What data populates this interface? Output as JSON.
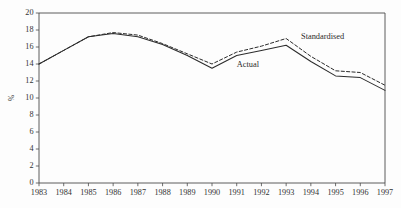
{
  "chart_data": {
    "type": "line",
    "title": "",
    "subtitle": "",
    "xlabel": "",
    "ylabel": "%",
    "categories": [
      "1983",
      "1984",
      "1985",
      "1986",
      "1987",
      "1988",
      "1989",
      "1990",
      "1991",
      "1992",
      "1993",
      "1994",
      "1995",
      "1996",
      "1997"
    ],
    "x": [
      1983,
      1984,
      1985,
      1986,
      1987,
      1988,
      1989,
      1990,
      1991,
      1992,
      1993,
      1994,
      1995,
      1996,
      1997
    ],
    "series": [
      {
        "name": "Actual",
        "style": "solid",
        "color": "#2b2b2b",
        "values": [
          14.0,
          15.6,
          17.2,
          17.6,
          17.2,
          16.3,
          15.0,
          13.5,
          15.0,
          15.6,
          16.2,
          14.3,
          12.6,
          12.4,
          10.9
        ]
      },
      {
        "name": "Standardised",
        "style": "dashed",
        "color": "#2b2b2b",
        "values": [
          14.0,
          15.6,
          17.2,
          17.7,
          17.4,
          16.4,
          15.2,
          14.0,
          15.4,
          16.1,
          17.0,
          14.9,
          13.2,
          13.0,
          11.5
        ]
      }
    ],
    "ylim": [
      0,
      20
    ],
    "yticks": [
      0,
      2,
      4,
      6,
      8,
      10,
      12,
      14,
      16,
      18,
      20
    ],
    "ytick_labels": [
      "0",
      "2",
      "4",
      "6",
      "8",
      "10",
      "12",
      "14",
      "16",
      "18",
      "20"
    ],
    "xlim": [
      1983,
      1997
    ],
    "grid": false,
    "legend": "inline-annotations",
    "annotations": [
      {
        "text": "Actual",
        "x": 1991.0,
        "y": 13.6,
        "anchor": "start"
      },
      {
        "text": "Standardised",
        "x": 1993.6,
        "y": 16.9,
        "anchor": "start"
      }
    ]
  },
  "figure": {
    "background": "#fdfdfd",
    "axis_color": "#4a4a4a",
    "line_color": "#2b2b2b",
    "text_color": "#333333"
  }
}
